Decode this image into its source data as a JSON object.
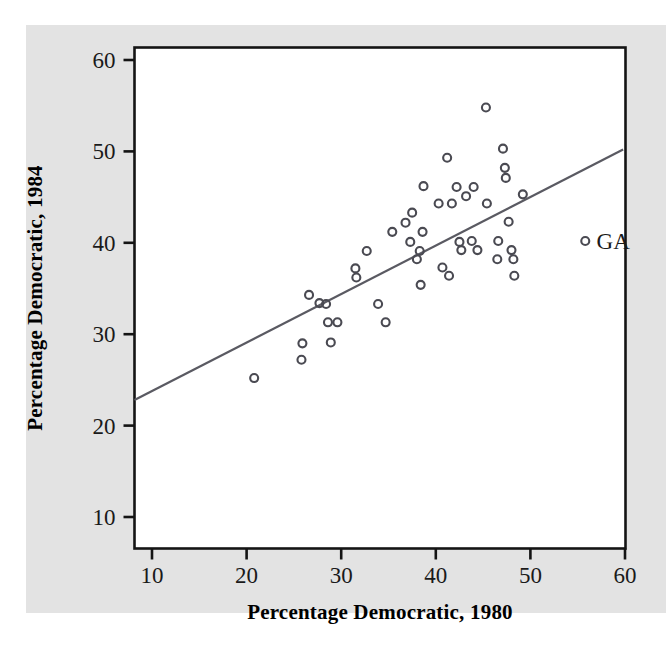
{
  "figure": {
    "background_color": "#e3e3e3",
    "plot_background_color": "#ffffff",
    "frame_color": "#141414",
    "marker_color": "#4a4a52",
    "line_color": "#5a5a62"
  },
  "chart_data": {
    "type": "scatter",
    "title": "",
    "xlabel": "Percentage Democratic, 1980",
    "ylabel": "Percentage Democratic, 1984",
    "xlim": [
      8,
      61
    ],
    "ylim": [
      7.5,
      61.5
    ],
    "xticks": [
      10,
      20,
      30,
      40,
      50,
      60
    ],
    "yticks": [
      10,
      20,
      30,
      40,
      50,
      60
    ],
    "xtick_labels": [
      "10",
      "20",
      "30",
      "40",
      "50",
      "60"
    ],
    "ytick_labels": [
      "10",
      "20",
      "30",
      "40",
      "50",
      "60"
    ],
    "grid": false,
    "legend_position": "none",
    "points": [
      {
        "x": 20.8,
        "y": 25.2
      },
      {
        "x": 25.8,
        "y": 27.2
      },
      {
        "x": 25.9,
        "y": 29.0
      },
      {
        "x": 26.6,
        "y": 34.3
      },
      {
        "x": 27.7,
        "y": 33.4
      },
      {
        "x": 28.4,
        "y": 33.3
      },
      {
        "x": 28.6,
        "y": 31.3
      },
      {
        "x": 28.9,
        "y": 29.1
      },
      {
        "x": 29.6,
        "y": 31.3
      },
      {
        "x": 31.5,
        "y": 37.2
      },
      {
        "x": 31.6,
        "y": 36.2
      },
      {
        "x": 32.7,
        "y": 39.1
      },
      {
        "x": 33.9,
        "y": 33.3
      },
      {
        "x": 34.7,
        "y": 31.3
      },
      {
        "x": 35.4,
        "y": 41.2
      },
      {
        "x": 36.8,
        "y": 42.2
      },
      {
        "x": 37.3,
        "y": 40.1
      },
      {
        "x": 37.5,
        "y": 43.3
      },
      {
        "x": 38.0,
        "y": 38.2
      },
      {
        "x": 38.3,
        "y": 39.1
      },
      {
        "x": 38.4,
        "y": 35.4
      },
      {
        "x": 38.6,
        "y": 41.2
      },
      {
        "x": 38.7,
        "y": 46.2
      },
      {
        "x": 40.3,
        "y": 44.3
      },
      {
        "x": 40.7,
        "y": 37.3
      },
      {
        "x": 41.2,
        "y": 49.3
      },
      {
        "x": 41.4,
        "y": 36.4
      },
      {
        "x": 41.7,
        "y": 44.3
      },
      {
        "x": 42.2,
        "y": 46.1
      },
      {
        "x": 42.5,
        "y": 40.1
      },
      {
        "x": 42.7,
        "y": 39.2
      },
      {
        "x": 43.2,
        "y": 45.1
      },
      {
        "x": 43.8,
        "y": 40.2
      },
      {
        "x": 44.0,
        "y": 46.1
      },
      {
        "x": 44.4,
        "y": 39.2
      },
      {
        "x": 45.3,
        "y": 54.8
      },
      {
        "x": 45.4,
        "y": 44.3
      },
      {
        "x": 46.5,
        "y": 38.2
      },
      {
        "x": 46.6,
        "y": 40.2
      },
      {
        "x": 47.1,
        "y": 50.3
      },
      {
        "x": 47.3,
        "y": 48.2
      },
      {
        "x": 47.4,
        "y": 47.1
      },
      {
        "x": 47.7,
        "y": 42.3
      },
      {
        "x": 48.0,
        "y": 39.2
      },
      {
        "x": 48.2,
        "y": 38.2
      },
      {
        "x": 48.3,
        "y": 36.4
      },
      {
        "x": 49.2,
        "y": 45.3
      }
    ],
    "fit_line": {
      "x_start": 8.0,
      "y_start": 22.8,
      "x_end": 59.8,
      "y_end": 50.2,
      "label": "least-squares fit"
    },
    "annotations": [
      {
        "label": "GA",
        "marker_x": 55.8,
        "marker_y": 40.2,
        "text_x": 57.0,
        "text_y": 40.2
      }
    ]
  }
}
